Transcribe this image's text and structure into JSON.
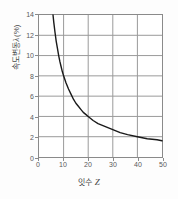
{
  "chart_data": {
    "type": "line",
    "title": "",
    "xlabel": "잇수 Z",
    "xlabel_text": "잇수",
    "xlabel_symbol": "Z",
    "ylabel": "속도변동 λ (%)",
    "ylabel_text_lead": "속도변동",
    "ylabel_symbol": "λ",
    "ylabel_text_unit": "(%)",
    "xlim": [
      0,
      50
    ],
    "ylim": [
      0,
      14
    ],
    "xticks": [
      0,
      10,
      20,
      30,
      40,
      50
    ],
    "yticks": [
      0,
      2,
      4,
      6,
      8,
      10,
      12,
      14
    ],
    "grid": true,
    "grid_x": [
      10,
      20,
      30,
      40
    ],
    "grid_y": [
      2,
      4,
      6,
      8,
      10,
      12
    ],
    "legend": null,
    "series": [
      {
        "name": "속도변동률",
        "relation": "lambda = 40 / Z",
        "x": [
          5.7,
          6,
          6.5,
          7,
          7.5,
          8,
          8.5,
          9,
          9.5,
          10,
          11,
          12,
          13,
          14,
          15,
          16,
          17,
          18,
          19,
          20,
          22,
          24,
          26,
          28,
          30,
          33,
          36,
          40,
          44,
          48,
          50
        ],
        "y": [
          14.0,
          13.3,
          12.3,
          11.4,
          10.7,
          10.0,
          9.4,
          8.9,
          8.4,
          8.0,
          7.3,
          6.7,
          6.2,
          5.7,
          5.3,
          5.0,
          4.7,
          4.4,
          4.2,
          4.0,
          3.6,
          3.3,
          3.1,
          2.9,
          2.7,
          2.4,
          2.2,
          2.0,
          1.8,
          1.7,
          1.6
        ]
      }
    ],
    "colors": {
      "curve": "#1a1a1a",
      "grid": "#9a9a9a",
      "axis": "#8a8a8a",
      "tick_text": "#5a5a5a",
      "background": "#ffffff",
      "page_background": "#fdfdfd"
    }
  }
}
